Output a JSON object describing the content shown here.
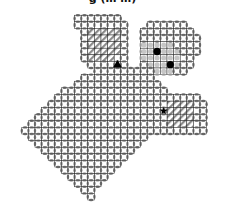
{
  "title": "g (… …)",
  "colors": {
    "grid": "#222222",
    "wall": "#555555",
    "hatch": "#8a8a8a",
    "gray_region": "#b8b8b8",
    "agent": "#000000",
    "goal": "#000000"
  },
  "map": {
    "cols": 32,
    "rows": 32,
    "regions": [
      {
        "name": "upper-left-room",
        "type": "open",
        "cells": [
          [
            11,
            2
          ],
          [
            12,
            2
          ],
          [
            13,
            2
          ],
          [
            14,
            2
          ],
          [
            15,
            2
          ],
          [
            16,
            2
          ],
          [
            17,
            2
          ],
          [
            11,
            3
          ],
          [
            12,
            3
          ],
          [
            13,
            3
          ],
          [
            14,
            3
          ],
          [
            15,
            3
          ],
          [
            16,
            3
          ],
          [
            17,
            3
          ],
          [
            18,
            3
          ],
          [
            12,
            4
          ],
          [
            13,
            4
          ],
          [
            14,
            4
          ],
          [
            15,
            4
          ],
          [
            16,
            4
          ],
          [
            17,
            4
          ],
          [
            18,
            4
          ],
          [
            12,
            5
          ],
          [
            13,
            5
          ],
          [
            14,
            5
          ],
          [
            15,
            5
          ],
          [
            16,
            5
          ],
          [
            17,
            5
          ],
          [
            18,
            5
          ],
          [
            12,
            6
          ],
          [
            13,
            6
          ],
          [
            14,
            6
          ],
          [
            15,
            6
          ],
          [
            16,
            6
          ],
          [
            17,
            6
          ],
          [
            18,
            6
          ],
          [
            12,
            7
          ],
          [
            13,
            7
          ],
          [
            14,
            7
          ],
          [
            15,
            7
          ],
          [
            16,
            7
          ],
          [
            17,
            7
          ],
          [
            18,
            7
          ],
          [
            12,
            8
          ],
          [
            13,
            8
          ],
          [
            14,
            8
          ],
          [
            15,
            8
          ],
          [
            16,
            8
          ],
          [
            17,
            8
          ],
          [
            18,
            8
          ],
          [
            13,
            9
          ],
          [
            14,
            9
          ],
          [
            15,
            9
          ],
          [
            16,
            9
          ],
          [
            17,
            9
          ],
          [
            18,
            9
          ]
        ]
      },
      {
        "name": "upper-left-hatched",
        "type": "hatched",
        "cells": [
          [
            13,
            4
          ],
          [
            14,
            4
          ],
          [
            15,
            4
          ],
          [
            16,
            4
          ],
          [
            17,
            4
          ],
          [
            13,
            5
          ],
          [
            14,
            5
          ],
          [
            15,
            5
          ],
          [
            16,
            5
          ],
          [
            17,
            5
          ],
          [
            13,
            6
          ],
          [
            14,
            6
          ],
          [
            15,
            6
          ],
          [
            16,
            6
          ],
          [
            17,
            6
          ],
          [
            13,
            7
          ],
          [
            14,
            7
          ],
          [
            15,
            7
          ],
          [
            16,
            7
          ],
          [
            17,
            7
          ],
          [
            13,
            8
          ],
          [
            14,
            8
          ],
          [
            15,
            8
          ],
          [
            16,
            8
          ]
        ]
      },
      {
        "name": "upper-right-room",
        "type": "open",
        "cells": [
          [
            22,
            3
          ],
          [
            23,
            3
          ],
          [
            24,
            3
          ],
          [
            25,
            3
          ],
          [
            26,
            3
          ],
          [
            27,
            3
          ],
          [
            21,
            4
          ],
          [
            22,
            4
          ],
          [
            23,
            4
          ],
          [
            24,
            4
          ],
          [
            25,
            4
          ],
          [
            26,
            4
          ],
          [
            27,
            4
          ],
          [
            28,
            4
          ],
          [
            21,
            5
          ],
          [
            22,
            5
          ],
          [
            23,
            5
          ],
          [
            24,
            5
          ],
          [
            25,
            5
          ],
          [
            26,
            5
          ],
          [
            27,
            5
          ],
          [
            28,
            5
          ],
          [
            29,
            5
          ],
          [
            21,
            6
          ],
          [
            22,
            6
          ],
          [
            23,
            6
          ],
          [
            24,
            6
          ],
          [
            25,
            6
          ],
          [
            26,
            6
          ],
          [
            27,
            6
          ],
          [
            28,
            6
          ],
          [
            29,
            6
          ],
          [
            21,
            7
          ],
          [
            22,
            7
          ],
          [
            23,
            7
          ],
          [
            24,
            7
          ],
          [
            25,
            7
          ],
          [
            26,
            7
          ],
          [
            27,
            7
          ],
          [
            28,
            7
          ],
          [
            29,
            7
          ],
          [
            21,
            8
          ],
          [
            22,
            8
          ],
          [
            23,
            8
          ],
          [
            24,
            8
          ],
          [
            25,
            8
          ],
          [
            26,
            8
          ],
          [
            27,
            8
          ],
          [
            28,
            8
          ],
          [
            21,
            9
          ],
          [
            22,
            9
          ],
          [
            23,
            9
          ],
          [
            24,
            9
          ],
          [
            25,
            9
          ],
          [
            26,
            9
          ],
          [
            27,
            9
          ],
          [
            28,
            9
          ],
          [
            22,
            10
          ],
          [
            23,
            10
          ],
          [
            24,
            10
          ],
          [
            25,
            10
          ],
          [
            26,
            10
          ],
          [
            27,
            10
          ]
        ]
      },
      {
        "name": "upper-right-gray",
        "type": "gray",
        "cells": [
          [
            21,
            6
          ],
          [
            22,
            6
          ],
          [
            23,
            6
          ],
          [
            24,
            6
          ],
          [
            25,
            6
          ],
          [
            21,
            7
          ],
          [
            22,
            7
          ],
          [
            23,
            7
          ],
          [
            24,
            7
          ],
          [
            25,
            7
          ],
          [
            26,
            7
          ],
          [
            21,
            8
          ],
          [
            22,
            8
          ],
          [
            23,
            8
          ],
          [
            24,
            8
          ],
          [
            25,
            8
          ],
          [
            26,
            8
          ],
          [
            22,
            9
          ],
          [
            23,
            9
          ],
          [
            24,
            9
          ],
          [
            25,
            9
          ],
          [
            26,
            9
          ],
          [
            23,
            10
          ],
          [
            24,
            10
          ],
          [
            25,
            10
          ]
        ]
      },
      {
        "name": "main-body",
        "type": "open",
        "cells": []
      },
      {
        "name": "lower-right-hatched",
        "type": "hatched",
        "cells": [
          [
            25,
            15
          ],
          [
            26,
            15
          ],
          [
            27,
            15
          ],
          [
            28,
            15
          ],
          [
            25,
            16
          ],
          [
            26,
            16
          ],
          [
            27,
            16
          ],
          [
            28,
            16
          ],
          [
            25,
            17
          ],
          [
            26,
            17
          ],
          [
            27,
            17
          ],
          [
            28,
            17
          ],
          [
            25,
            18
          ],
          [
            26,
            18
          ],
          [
            27,
            18
          ],
          [
            28,
            18
          ]
        ]
      }
    ],
    "main_body_rows": [
      {
        "row": 10,
        "from": 14,
        "to": 21
      },
      {
        "row": 11,
        "from": 12,
        "to": 22
      },
      {
        "row": 12,
        "from": 11,
        "to": 23
      },
      {
        "row": 13,
        "from": 9,
        "to": 24
      },
      {
        "row": 14,
        "from": 8,
        "to": 29
      },
      {
        "row": 15,
        "from": 7,
        "to": 30
      },
      {
        "row": 16,
        "from": 6,
        "to": 30
      },
      {
        "row": 17,
        "from": 5,
        "to": 30
      },
      {
        "row": 18,
        "from": 4,
        "to": 30
      },
      {
        "row": 19,
        "from": 3,
        "to": 30
      },
      {
        "row": 20,
        "from": 4,
        "to": 21
      },
      {
        "row": 21,
        "from": 5,
        "to": 20
      },
      {
        "row": 22,
        "from": 6,
        "to": 19
      },
      {
        "row": 23,
        "from": 7,
        "to": 18
      },
      {
        "row": 24,
        "from": 8,
        "to": 17
      },
      {
        "row": 25,
        "from": 9,
        "to": 16
      },
      {
        "row": 26,
        "from": 10,
        "to": 15
      },
      {
        "row": 27,
        "from": 11,
        "to": 14
      },
      {
        "row": 28,
        "from": 12,
        "to": 13
      },
      {
        "row": 29,
        "from": 13,
        "to": 13
      }
    ],
    "markers": [
      {
        "name": "agent",
        "shape": "triangle",
        "cell": [
          17,
          9
        ]
      },
      {
        "name": "goal",
        "shape": "star",
        "cell": [
          24,
          16
        ]
      },
      {
        "name": "dot-1",
        "shape": "dot",
        "cell": [
          23,
          7
        ]
      },
      {
        "name": "dot-2",
        "shape": "dot",
        "cell": [
          25,
          9
        ]
      }
    ]
  }
}
